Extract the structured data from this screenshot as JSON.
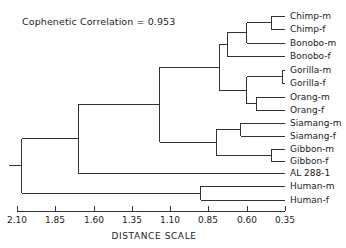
{
  "annotation": "Cophenetic Correlation = 0.953",
  "chart_data": {
    "type": "dendrogram",
    "title": "",
    "annotation": "Cophenetic Correlation = 0.953",
    "xlabel": "DISTANCE SCALE",
    "x_ticks": [
      "2.10",
      "1.85",
      "1.60",
      "1.35",
      "1.10",
      "0.85",
      "0.60",
      "0.35"
    ],
    "x_range": [
      2.1,
      0.35
    ],
    "leaves": [
      "Chimp-m",
      "Chimp-f",
      "Bonobo-m",
      "Bonobo-f",
      "Gorilla-m",
      "Gorilla-f",
      "Orang-m",
      "Orang-f",
      "Siamang-m",
      "Siamang-f",
      "Gibbon-m",
      "Gibbon-f",
      "AL 288-1",
      "Human-m",
      "Human-f"
    ],
    "merges": [
      {
        "join": [
          "Chimp-m",
          "Chimp-f"
        ],
        "distance": 0.44
      },
      {
        "join": [
          "(Chimp)",
          "Bonobo-m"
        ],
        "distance": 0.6
      },
      {
        "join": [
          "(Chimp,Bonobo-m)",
          "Bonobo-f"
        ],
        "distance": 0.73
      },
      {
        "join": [
          "Gorilla-m",
          "Gorilla-f"
        ],
        "distance": 0.37
      },
      {
        "join": [
          "Orang-m",
          "Orang-f"
        ],
        "distance": 0.54
      },
      {
        "join": [
          "(Gorilla)",
          "(Orang)"
        ],
        "distance": 0.6
      },
      {
        "join": [
          "(Pan)",
          "(Gorilla,Orang)"
        ],
        "distance": 0.78
      },
      {
        "join": [
          "Siamang-m",
          "Siamang-f"
        ],
        "distance": 0.64
      },
      {
        "join": [
          "Gibbon-m",
          "Gibbon-f"
        ],
        "distance": 0.44
      },
      {
        "join": [
          "(Siamang)",
          "(Gibbon)"
        ],
        "distance": 0.8
      },
      {
        "join": [
          "(Great apes)",
          "(Lesser apes)"
        ],
        "distance": 1.17
      },
      {
        "join": [
          "(Apes)",
          "AL 288-1"
        ],
        "distance": 1.7
      },
      {
        "join": [
          "Human-m",
          "Human-f"
        ],
        "distance": 0.9
      },
      {
        "join": [
          "(Apes,AL 288-1)",
          "(Human)"
        ],
        "distance": 2.07
      }
    ]
  },
  "axis": {
    "title": "DISTANCE SCALE",
    "ticks": [
      {
        "label": "2.10",
        "x": 17
      },
      {
        "label": "1.85",
        "x": 55
      },
      {
        "label": "1.60",
        "x": 94
      },
      {
        "label": "1.35",
        "x": 132
      },
      {
        "label": "1.10",
        "x": 170
      },
      {
        "label": "0.85",
        "x": 208
      },
      {
        "label": "0.60",
        "x": 247
      },
      {
        "label": "0.35",
        "x": 285
      }
    ]
  },
  "leaves": [
    {
      "label": "Chimp-m",
      "y": 16
    },
    {
      "label": "Chimp-f",
      "y": 29
    },
    {
      "label": "Bonobo-m",
      "y": 43
    },
    {
      "label": "Bonobo-f",
      "y": 56
    },
    {
      "label": "Gorilla-m",
      "y": 70
    },
    {
      "label": "Gorilla-f",
      "y": 83
    },
    {
      "label": "Orang-m",
      "y": 97
    },
    {
      "label": "Orang-f",
      "y": 110
    },
    {
      "label": "Siamang-m",
      "y": 123
    },
    {
      "label": "Siamang-f",
      "y": 136
    },
    {
      "label": "Gibbon-m",
      "y": 149
    },
    {
      "label": "Gibbon-f",
      "y": 161
    },
    {
      "label": "AL 288-1",
      "y": 173
    },
    {
      "label": "Human-m",
      "y": 186
    },
    {
      "label": "Human-f",
      "y": 200
    }
  ],
  "colors": {
    "line": "#333333",
    "text": "#222222",
    "background": "#ffffff"
  }
}
